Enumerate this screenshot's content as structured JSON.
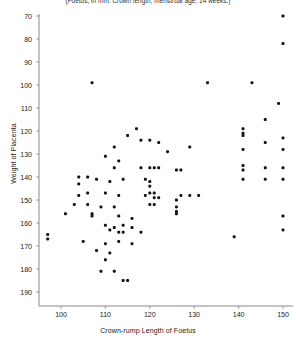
{
  "figure": {
    "caption": "(Foetus, in mm. Crown length; menstrual age, 14 weeks.)",
    "background_color": "#ffffff",
    "marker_color": "#111111",
    "axis_color": "#8a8a8a"
  },
  "chart_data": {
    "type": "scatter",
    "title": "(Foetus, in mm. Crown length; menstrual age, 14 weeks.)",
    "xlabel": "Crown-rump  Length of Foetus",
    "ylabel": "Weight of Placenta",
    "xlim": [
      95,
      153
    ],
    "ylim": [
      63,
      193
    ],
    "xticks": [
      100,
      110,
      120,
      130,
      140,
      150
    ],
    "yticks": [
      70,
      80,
      90,
      100,
      110,
      120,
      130,
      140,
      150,
      160,
      170,
      180,
      190
    ],
    "grid": false,
    "legend": null,
    "marker_size_px": 3,
    "points": [
      [
        150,
        190
      ],
      [
        150,
        178
      ],
      [
        149,
        152
      ],
      [
        143,
        161
      ],
      [
        133,
        161
      ],
      [
        107,
        161
      ],
      [
        117,
        141
      ],
      [
        141,
        141
      ],
      [
        141,
        139
      ],
      [
        141,
        138
      ],
      [
        115,
        138
      ],
      [
        146,
        145
      ],
      [
        129,
        133
      ],
      [
        112,
        133
      ],
      [
        120,
        136
      ],
      [
        122,
        135
      ],
      [
        118,
        136
      ],
      [
        124,
        131
      ],
      [
        141,
        132
      ],
      [
        146,
        135
      ],
      [
        150,
        137
      ],
      [
        150,
        132
      ],
      [
        110,
        129
      ],
      [
        113,
        127
      ],
      [
        112,
        124
      ],
      [
        118,
        124
      ],
      [
        120,
        124
      ],
      [
        121,
        124
      ],
      [
        122,
        124
      ],
      [
        126,
        123
      ],
      [
        127,
        123
      ],
      [
        141,
        125
      ],
      [
        141,
        123
      ],
      [
        146,
        124
      ],
      [
        150,
        124
      ],
      [
        104,
        120
      ],
      [
        106,
        120
      ],
      [
        108,
        119
      ],
      [
        111,
        118
      ],
      [
        114,
        119
      ],
      [
        119,
        119
      ],
      [
        120,
        118
      ],
      [
        120,
        116
      ],
      [
        141,
        119
      ],
      [
        146,
        119
      ],
      [
        150,
        119
      ],
      [
        104,
        117
      ],
      [
        120,
        113
      ],
      [
        121,
        113
      ],
      [
        104,
        112
      ],
      [
        106,
        113
      ],
      [
        110,
        113
      ],
      [
        113,
        112
      ],
      [
        119,
        112
      ],
      [
        121,
        111
      ],
      [
        122,
        111
      ],
      [
        127,
        112
      ],
      [
        129,
        112
      ],
      [
        131,
        112
      ],
      [
        126,
        110
      ],
      [
        120,
        108
      ],
      [
        121,
        108
      ],
      [
        103,
        108
      ],
      [
        106,
        108
      ],
      [
        109,
        107
      ],
      [
        112,
        107
      ],
      [
        126,
        107
      ],
      [
        126,
        105
      ],
      [
        126,
        104
      ],
      [
        101,
        104
      ],
      [
        107,
        104
      ],
      [
        107,
        103
      ],
      [
        113,
        103
      ],
      [
        116,
        102
      ],
      [
        150,
        103
      ],
      [
        110,
        99
      ],
      [
        112,
        98
      ],
      [
        114,
        99
      ],
      [
        116,
        98
      ],
      [
        111,
        97
      ],
      [
        113,
        96
      ],
      [
        118,
        96
      ],
      [
        97,
        95
      ],
      [
        97,
        93
      ],
      [
        105,
        92
      ],
      [
        110,
        91
      ],
      [
        113,
        92
      ],
      [
        116,
        91
      ],
      [
        114,
        96
      ],
      [
        139,
        94
      ],
      [
        150,
        97
      ],
      [
        108,
        88
      ],
      [
        111,
        87
      ],
      [
        110,
        84
      ],
      [
        109,
        79
      ],
      [
        112,
        79
      ],
      [
        114,
        75
      ],
      [
        115,
        75
      ]
    ]
  },
  "axes": {
    "y_tick_labels": [
      "190",
      "180",
      "170",
      "160",
      "150",
      "140",
      "130",
      "120",
      "110",
      "100",
      "90",
      "80",
      "70"
    ],
    "x_tick_labels": [
      "100",
      "110",
      "120",
      "130",
      "140",
      "150"
    ],
    "y_axis_title": "Weight of Placenta",
    "x_axis_title": "Crown-rump  Length of Foetus"
  }
}
